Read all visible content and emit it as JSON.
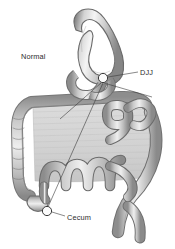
{
  "figure": {
    "title_label": "Normal",
    "background_color": "#ffffff",
    "ink_color": "#2b2b2b",
    "organ_fill_light": "#e6e6e6",
    "organ_fill_mid": "#c2c2c2",
    "organ_fill_dark": "#8f8f8f",
    "organ_outline": "#4a4a4a"
  },
  "labels": {
    "normal": "Normal",
    "djj": "DJJ",
    "cecum": "Cecum"
  },
  "markers": {
    "djj": {
      "x": 103,
      "y": 78,
      "r": 5
    },
    "cecum": {
      "x": 47,
      "y": 211,
      "r": 5
    }
  },
  "leaders": {
    "djj_line": "M108,78 L138,72",
    "cecum_line": "M52,212 L64,216",
    "djj_to_cecum_crossing": "M103,83 L47,207",
    "djj_secondary": "M103,83 L150,95"
  }
}
